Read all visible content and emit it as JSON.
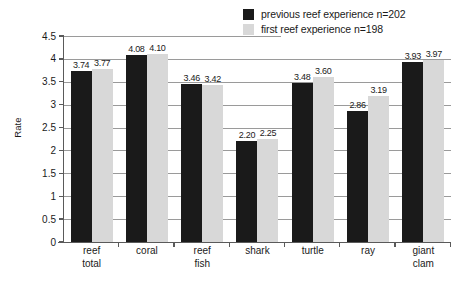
{
  "chart_data": {
    "type": "bar",
    "title": "",
    "xlabel": "",
    "ylabel": "Rate",
    "ylim": [
      0,
      4.5
    ],
    "ytick_labels": [
      "4.5",
      "4",
      "3.5",
      "3",
      "2.5",
      "2",
      "1.5",
      "1",
      "0.5",
      "0"
    ],
    "ytick_values": [
      4.5,
      4,
      3.5,
      3,
      2.5,
      2,
      1.5,
      1,
      0.5,
      0
    ],
    "grid": true,
    "legend_position": "top-right",
    "categories": [
      "reef\ntotal",
      "coral",
      "reef\nfish",
      "shark",
      "turtle",
      "ray",
      "giant\nclam"
    ],
    "series": [
      {
        "name": "previous reef experience n=202",
        "color": "#1a1a1a",
        "values": [
          3.74,
          4.08,
          3.46,
          2.2,
          3.48,
          2.86,
          3.93
        ],
        "labels": [
          "3.74",
          "4.08",
          "3.46",
          "2.20",
          "3.48",
          "2.86",
          "3.93"
        ]
      },
      {
        "name": "first reef experience n=198",
        "color": "#d8d8d8",
        "values": [
          3.77,
          4.1,
          3.42,
          2.25,
          3.6,
          3.19,
          3.97
        ],
        "labels": [
          "3.77",
          "4.10",
          "3.42",
          "2.25",
          "3.60",
          "3.19",
          "3.97"
        ]
      }
    ]
  },
  "legend": {
    "items": [
      {
        "label": "previous reef experience n=202",
        "color": "#1a1a1a"
      },
      {
        "label": "first reef experience n=198",
        "color": "#d8d8d8"
      }
    ]
  },
  "axis": {
    "y_title": "Rate"
  }
}
